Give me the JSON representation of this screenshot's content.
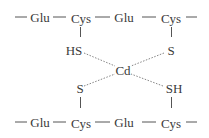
{
  "diagram": {
    "top_chain": {
      "residues": [
        "Glu",
        "Cys",
        "Glu",
        "Cys"
      ]
    },
    "bottom_chain": {
      "residues": [
        "Glu",
        "Cys",
        "Glu",
        "Cys"
      ]
    },
    "side_groups": {
      "top_left": "HS",
      "top_right": "S",
      "bottom_left": "S",
      "bottom_right": "SH"
    },
    "center_metal": "Cd",
    "colors": {
      "text": "#3a3a3a",
      "line": "#555555",
      "background": "#ffffff"
    }
  }
}
